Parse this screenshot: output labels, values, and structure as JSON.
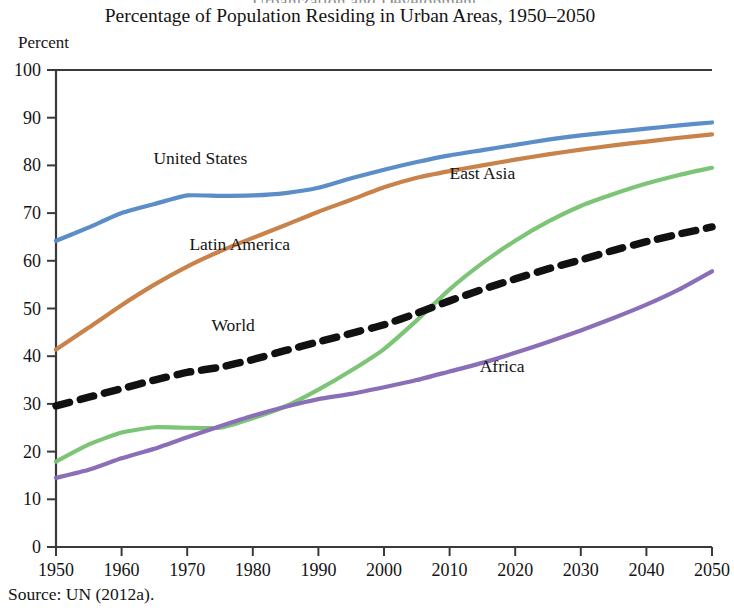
{
  "figure": {
    "title": "Percentage of Population Residing in Urban Areas, 1950–2050",
    "axis_unit_label": "Percent",
    "source_note": "Source: UN (2012a).",
    "cropped_header_sliver": "Urbanization and Development"
  },
  "chart_data": {
    "type": "line",
    "title": "Percentage of Population Residing in Urban Areas, 1950–2050",
    "subtitle": "",
    "xlabel": "",
    "ylabel": "Percent",
    "xlim": [
      1950,
      2050
    ],
    "ylim": [
      0,
      100
    ],
    "xticks": [
      1950,
      1960,
      1970,
      1980,
      1990,
      2000,
      2010,
      2020,
      2030,
      2040,
      2050
    ],
    "yticks": [
      0,
      10,
      20,
      30,
      40,
      50,
      60,
      70,
      80,
      90,
      100
    ],
    "grid": false,
    "legend_position": "inline-annotations",
    "x": [
      1950,
      1955,
      1960,
      1965,
      1970,
      1975,
      1980,
      1985,
      1990,
      1995,
      2000,
      2005,
      2010,
      2015,
      2020,
      2025,
      2030,
      2035,
      2040,
      2045,
      2050
    ],
    "series": [
      {
        "name": "United States",
        "color": "#5b8ec9",
        "style": "solid",
        "label_x": 1972,
        "label_y": 81.5,
        "values": [
          64.2,
          67.0,
          70.0,
          71.9,
          73.7,
          73.6,
          73.7,
          74.2,
          75.3,
          77.3,
          79.1,
          80.7,
          82.1,
          83.2,
          84.3,
          85.4,
          86.3,
          87.0,
          87.7,
          88.4,
          89.0
        ]
      },
      {
        "name": "Latin America",
        "color": "#c8824a",
        "style": "solid",
        "label_x": 1978,
        "label_y": 63.5,
        "values": [
          41.4,
          46.0,
          50.7,
          55.0,
          58.8,
          62.0,
          64.8,
          67.5,
          70.3,
          72.8,
          75.4,
          77.4,
          78.8,
          80.0,
          81.2,
          82.3,
          83.3,
          84.2,
          85.0,
          85.8,
          86.5
        ]
      },
      {
        "name": "East Asia",
        "color": "#7cc576",
        "style": "solid",
        "label_x": 2015,
        "label_y": 78.5,
        "values": [
          17.9,
          21.5,
          24.0,
          25.1,
          25.0,
          25.0,
          27.0,
          29.5,
          33.0,
          37.0,
          41.5,
          47.5,
          54.0,
          59.5,
          64.2,
          68.2,
          71.5,
          74.0,
          76.2,
          78.0,
          79.5
        ]
      },
      {
        "name": "World",
        "color": "#111111",
        "style": "dashed",
        "label_x": 1977,
        "label_y": 46.5,
        "values": [
          29.6,
          31.4,
          33.2,
          35.0,
          36.6,
          37.7,
          39.3,
          41.2,
          43.0,
          44.8,
          46.6,
          49.0,
          51.6,
          54.0,
          56.2,
          58.3,
          60.2,
          62.2,
          64.0,
          65.6,
          67.1
        ]
      },
      {
        "name": "Africa",
        "color": "#8a6fb8",
        "style": "solid",
        "label_x": 2018,
        "label_y": 38.0,
        "values": [
          14.5,
          16.2,
          18.6,
          20.6,
          23.0,
          25.3,
          27.5,
          29.4,
          31.0,
          32.1,
          33.5,
          35.0,
          36.8,
          38.6,
          40.7,
          43.0,
          45.4,
          48.0,
          50.8,
          54.0,
          57.8
        ]
      }
    ]
  }
}
